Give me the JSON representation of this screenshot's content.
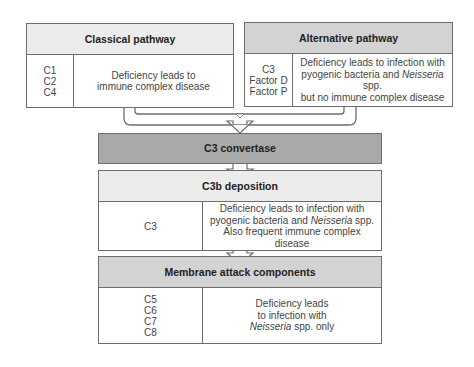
{
  "colors": {
    "header_light": "#ececec",
    "header_mid": "#d3d3d3",
    "header_dark": "#a9a9a9",
    "border": "#6d6d6d"
  },
  "classical": {
    "title": "Classical pathway",
    "components": [
      "C1",
      "C2",
      "C4"
    ],
    "description_lines": [
      "Deficiency leads to",
      "immune complex disease"
    ]
  },
  "alternative": {
    "title": "Alternative pathway",
    "components": [
      "C3",
      "Factor D",
      "Factor P"
    ],
    "description_line1": "Deficiency leads to infection with",
    "description_line2_pre": "pyogenic bacteria and ",
    "description_line2_italic": "Neisseria",
    "description_line2_post": " spp.",
    "description_line3": "but no  immune complex disease"
  },
  "convertase": {
    "title": "C3 convertase"
  },
  "deposition": {
    "title": "C3b deposition",
    "components": [
      "C3"
    ],
    "description_line1": "Deficiency leads to infection with",
    "description_line2_pre": "pyogenic bacteria and ",
    "description_line2_italic": "Neisseria",
    "description_line2_post": " spp.",
    "description_line3": "Also frequent immune complex disease"
  },
  "membrane": {
    "title": "Membrane attack components",
    "components": [
      "C5",
      "C6",
      "C7",
      "C8"
    ],
    "description_line1": "Deficiency leads",
    "description_line2": "to infection with",
    "description_line3_italic": "Neisseria",
    "description_line3_post": " spp. only"
  }
}
